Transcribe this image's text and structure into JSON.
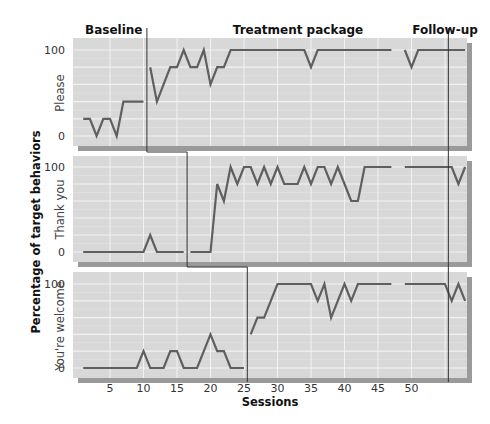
{
  "chart_data": {
    "type": "line",
    "title": "",
    "xlabel": "Sessions",
    "ylabel": "Percentage of target behaviors",
    "xlim": [
      0,
      58
    ],
    "ylim": [
      0,
      100
    ],
    "x_ticks": [
      5,
      10,
      15,
      20,
      25,
      30,
      35,
      40,
      45,
      50
    ],
    "y_ticks": [
      0,
      100
    ],
    "grid": true,
    "legend": "none",
    "phase_labels": [
      "Baseline",
      "Treatment package",
      "Follow-up"
    ],
    "phase_changes": {
      "treatment_start": [
        10.5,
        16.5,
        25.5
      ],
      "follow_up_start": 55.5
    },
    "panels": [
      {
        "name": "Please",
        "segments": [
          {
            "x": [
              1,
              2,
              3,
              4,
              5,
              6,
              7,
              8,
              9,
              10
            ],
            "y": [
              20,
              20,
              0,
              20,
              20,
              0,
              40,
              40,
              40,
              40
            ]
          },
          {
            "x": [
              11,
              12,
              13,
              14,
              15,
              16,
              17,
              18,
              19,
              20,
              21,
              22,
              23,
              24,
              25,
              26,
              27,
              28,
              29,
              30,
              31,
              32,
              33,
              34,
              35,
              36,
              37,
              38,
              39,
              40,
              41,
              42,
              43,
              44,
              45,
              46,
              47
            ],
            "y": [
              80,
              40,
              60,
              80,
              80,
              100,
              80,
              80,
              100,
              60,
              80,
              80,
              100,
              100,
              100,
              100,
              100,
              100,
              100,
              100,
              100,
              100,
              100,
              100,
              80,
              100,
              100,
              100,
              100,
              100,
              100,
              100,
              100,
              100,
              100,
              100,
              100
            ]
          },
          {
            "x": [
              49,
              50,
              51,
              52,
              53,
              54,
              55,
              56,
              57,
              58
            ],
            "y": [
              100,
              80,
              100,
              100,
              100,
              100,
              100,
              100,
              100,
              100
            ]
          }
        ]
      },
      {
        "name": "Thank you",
        "segments": [
          {
            "x": [
              1,
              2,
              3,
              4,
              5,
              6,
              7,
              8,
              9,
              10,
              11,
              12,
              13,
              14,
              15,
              16
            ],
            "y": [
              0,
              0,
              0,
              0,
              0,
              0,
              0,
              0,
              0,
              0,
              20,
              0,
              0,
              0,
              0,
              0
            ]
          },
          {
            "x": [
              17,
              18,
              19,
              20,
              21,
              22,
              23,
              24,
              25,
              26,
              27,
              28,
              29,
              30,
              31,
              32,
              33,
              34,
              35,
              36,
              37,
              38,
              39,
              40,
              41,
              42,
              43,
              44,
              45,
              46,
              47
            ],
            "y": [
              0,
              0,
              0,
              0,
              80,
              60,
              100,
              80,
              100,
              100,
              80,
              100,
              80,
              100,
              80,
              80,
              80,
              100,
              80,
              100,
              100,
              80,
              100,
              80,
              60,
              60,
              100,
              100,
              100,
              100,
              100
            ]
          },
          {
            "x": [
              49,
              50,
              51,
              52,
              53,
              54,
              55,
              56,
              57,
              58
            ],
            "y": [
              100,
              100,
              100,
              100,
              100,
              100,
              100,
              100,
              80,
              100
            ]
          }
        ]
      },
      {
        "name": "You're welcome",
        "segments": [
          {
            "x": [
              1,
              2,
              3,
              4,
              5,
              6,
              7,
              8,
              9,
              10,
              11,
              12,
              13,
              14,
              15,
              16,
              17,
              18,
              19,
              20,
              21,
              22,
              23,
              24,
              25
            ],
            "y": [
              0,
              0,
              0,
              0,
              0,
              0,
              0,
              0,
              0,
              20,
              0,
              0,
              0,
              20,
              20,
              0,
              0,
              0,
              20,
              40,
              20,
              20,
              0,
              0,
              0
            ]
          },
          {
            "x": [
              26,
              27,
              28,
              29,
              30,
              31,
              32,
              33,
              34,
              35,
              36,
              37,
              38,
              39,
              40,
              41,
              42,
              43,
              44,
              45,
              46,
              47
            ],
            "y": [
              40,
              60,
              60,
              80,
              100,
              100,
              100,
              100,
              100,
              100,
              80,
              100,
              60,
              80,
              100,
              80,
              100,
              100,
              100,
              100,
              100,
              100
            ]
          },
          {
            "x": [
              49,
              50,
              51,
              52,
              53,
              54,
              55,
              56,
              57,
              58
            ],
            "y": [
              100,
              100,
              100,
              100,
              100,
              100,
              100,
              80,
              100,
              80
            ]
          }
        ]
      }
    ]
  },
  "colors": {
    "panel_bg": "#d8d8d8",
    "grid": "#f2f2f2",
    "shadow": "#9a9a9a",
    "data_line": "#5f5f5f",
    "phase_line": "#333333"
  }
}
